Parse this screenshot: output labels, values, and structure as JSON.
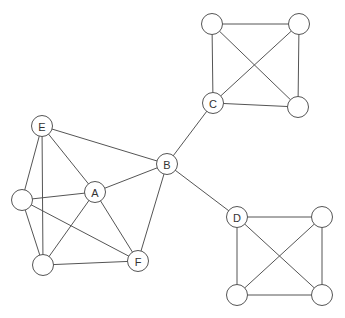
{
  "diagram": {
    "type": "graph",
    "node_radius": 10.5,
    "colors": {
      "stroke": "#555555",
      "fill": "#ffffff",
      "label": "#333333",
      "background": "#ffffff"
    },
    "nodes": [
      {
        "id": "E",
        "label": "E",
        "x": 42,
        "y": 126
      },
      {
        "id": "L1",
        "label": "",
        "x": 22,
        "y": 200
      },
      {
        "id": "L2",
        "label": "",
        "x": 43,
        "y": 265
      },
      {
        "id": "A",
        "label": "A",
        "x": 95,
        "y": 192
      },
      {
        "id": "F",
        "label": "F",
        "x": 138,
        "y": 261
      },
      {
        "id": "B",
        "label": "B",
        "x": 167,
        "y": 164
      },
      {
        "id": "C",
        "label": "C",
        "x": 213,
        "y": 103
      },
      {
        "id": "C1",
        "label": "",
        "x": 212,
        "y": 24
      },
      {
        "id": "C2",
        "label": "",
        "x": 299,
        "y": 24
      },
      {
        "id": "C3",
        "label": "",
        "x": 298,
        "y": 107
      },
      {
        "id": "D",
        "label": "D",
        "x": 237,
        "y": 217
      },
      {
        "id": "D1",
        "label": "",
        "x": 322,
        "y": 217
      },
      {
        "id": "D2",
        "label": "",
        "x": 237,
        "y": 295
      },
      {
        "id": "D3",
        "label": "",
        "x": 322,
        "y": 295
      }
    ],
    "edges": [
      [
        "E",
        "B"
      ],
      [
        "E",
        "A"
      ],
      [
        "E",
        "L1"
      ],
      [
        "E",
        "L2"
      ],
      [
        "L1",
        "A"
      ],
      [
        "L1",
        "F"
      ],
      [
        "L1",
        "L2"
      ],
      [
        "L2",
        "A"
      ],
      [
        "L2",
        "F"
      ],
      [
        "A",
        "B"
      ],
      [
        "A",
        "F"
      ],
      [
        "B",
        "F"
      ],
      [
        "B",
        "C"
      ],
      [
        "B",
        "D"
      ],
      [
        "C",
        "C1"
      ],
      [
        "C1",
        "C2"
      ],
      [
        "C2",
        "C3"
      ],
      [
        "C3",
        "C"
      ],
      [
        "C1",
        "C3"
      ],
      [
        "C",
        "C2"
      ],
      [
        "D",
        "D1"
      ],
      [
        "D1",
        "D3"
      ],
      [
        "D3",
        "D2"
      ],
      [
        "D2",
        "D"
      ],
      [
        "D",
        "D3"
      ],
      [
        "D1",
        "D2"
      ]
    ]
  }
}
